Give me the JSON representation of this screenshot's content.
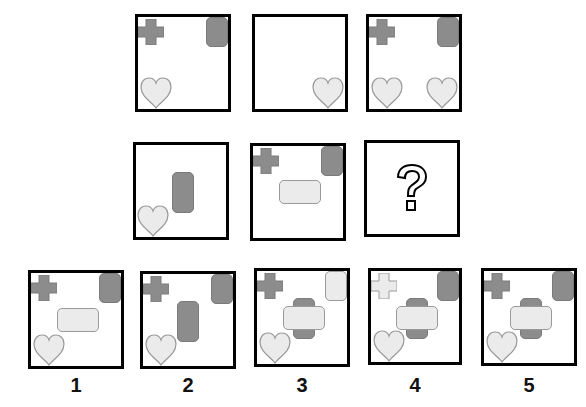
{
  "puzzle": {
    "type": "visual-matrix-reasoning",
    "grid_rows": 2,
    "grid_cols": 3,
    "colors": {
      "dark_fill": "#8c8c8c",
      "light_fill": "#ebebeb",
      "border": "#000000"
    },
    "cells": [
      {
        "row": 1,
        "col": 1,
        "contents": [
          "dark-cross-top-left",
          "dark-rect-top-right",
          "light-heart-bottom-left"
        ]
      },
      {
        "row": 1,
        "col": 2,
        "contents": [
          "light-heart-bottom-right"
        ]
      },
      {
        "row": 1,
        "col": 3,
        "contents": [
          "dark-cross-top-left",
          "dark-rect-top-right",
          "light-heart-bottom-left",
          "light-heart-bottom-right"
        ]
      },
      {
        "row": 2,
        "col": 1,
        "contents": [
          "dark-vertical-rect-center",
          "light-heart-bottom-left"
        ]
      },
      {
        "row": 2,
        "col": 2,
        "contents": [
          "dark-cross-top-left",
          "dark-rect-top-right",
          "light-horizontal-rect-center"
        ]
      },
      {
        "row": 2,
        "col": 3,
        "contents": [
          "question-mark"
        ]
      }
    ],
    "question_symbol": "?",
    "options": [
      {
        "label": "1",
        "contents": [
          "dark-cross-top-left",
          "dark-rect-top-right",
          "light-horizontal-rect-center",
          "light-heart-bottom-left"
        ]
      },
      {
        "label": "2",
        "contents": [
          "dark-cross-top-left",
          "dark-rect-top-right",
          "dark-vertical-rect-center",
          "light-heart-bottom-left"
        ]
      },
      {
        "label": "3",
        "contents": [
          "dark-cross-top-left",
          "light-rect-top-right",
          "dark-vertical-rect-center",
          "light-horizontal-rect-center",
          "light-heart-bottom-left"
        ]
      },
      {
        "label": "4",
        "contents": [
          "light-cross-top-left",
          "dark-rect-top-right",
          "dark-vertical-rect-center",
          "light-horizontal-rect-center",
          "light-heart-bottom-left"
        ]
      },
      {
        "label": "5",
        "contents": [
          "dark-cross-top-left",
          "dark-rect-top-right",
          "dark-vertical-rect-center",
          "light-horizontal-rect-center",
          "light-heart-bottom-left"
        ]
      }
    ]
  }
}
